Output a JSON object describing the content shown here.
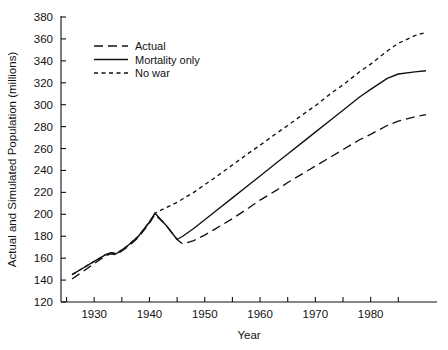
{
  "chart_data": {
    "type": "line",
    "title": "",
    "xlabel": "Year",
    "ylabel": "Actual and Simulated Population (millions)",
    "xlim": [
      1924,
      1992
    ],
    "ylim": [
      120,
      380
    ],
    "grid": false,
    "legend_position": "upper-left",
    "y_ticks": [
      120,
      140,
      160,
      180,
      200,
      220,
      240,
      260,
      280,
      300,
      320,
      340,
      360,
      380
    ],
    "y_tick_labels": [
      "120",
      "140",
      "160",
      "180",
      "200",
      "220",
      "240",
      "260",
      "280",
      "300",
      "320",
      "340",
      "360",
      "380"
    ],
    "x_ticks_major": [
      1930,
      1940,
      1950,
      1960,
      1970,
      1980
    ],
    "x_tick_labels": [
      "1930",
      "1940",
      "1950",
      "1960",
      "1970",
      "1980"
    ],
    "x_ticks_minor": [
      1925,
      1935,
      1945,
      1955,
      1965,
      1975,
      1985
    ],
    "series": [
      {
        "name": "Actual",
        "style": "long-dash",
        "dasharray": "9,5",
        "color": "#111111",
        "x": [
          1926,
          1928,
          1930,
          1932,
          1933,
          1934,
          1936,
          1938,
          1940,
          1941,
          1943,
          1945,
          1946,
          1948,
          1950,
          1952,
          1955,
          1958,
          1960,
          1963,
          1965,
          1968,
          1970,
          1973,
          1975,
          1978,
          1980,
          1983,
          1985,
          1988,
          1990
        ],
        "y": [
          141,
          148,
          155,
          162,
          164,
          163,
          170,
          179,
          192,
          200,
          190,
          177,
          173,
          176,
          181,
          187,
          196,
          206,
          213,
          222,
          229,
          238,
          244,
          253,
          259,
          268,
          273,
          281,
          285,
          289,
          291
        ]
      },
      {
        "name": "Mortality only",
        "style": "solid",
        "dasharray": "",
        "color": "#111111",
        "x": [
          1926,
          1928,
          1930,
          1932,
          1933,
          1934,
          1936,
          1938,
          1940,
          1941,
          1943,
          1945,
          1946,
          1948,
          1950,
          1952,
          1955,
          1958,
          1960,
          1963,
          1965,
          1968,
          1970,
          1973,
          1975,
          1978,
          1980,
          1983,
          1985,
          1988,
          1990
        ],
        "y": [
          145,
          151,
          157,
          163,
          165,
          164,
          171,
          180,
          193,
          201,
          190,
          177,
          180,
          187,
          195,
          203,
          215,
          227,
          235,
          247,
          255,
          267,
          275,
          287,
          295,
          307,
          314,
          324,
          328,
          330,
          331
        ]
      },
      {
        "name": "No war",
        "style": "short-dash",
        "dasharray": "4,3.5",
        "color": "#111111",
        "x": [
          1926,
          1928,
          1930,
          1932,
          1933,
          1934,
          1936,
          1938,
          1940,
          1941,
          1943,
          1945,
          1946,
          1948,
          1950,
          1952,
          1955,
          1958,
          1960,
          1963,
          1965,
          1968,
          1970,
          1973,
          1975,
          1978,
          1980,
          1983,
          1985,
          1988,
          1990
        ],
        "y": [
          145,
          151,
          157,
          163,
          165,
          164,
          171,
          180,
          193,
          201,
          206,
          211,
          214,
          220,
          227,
          234,
          245,
          256,
          263,
          274,
          281,
          292,
          299,
          311,
          318,
          330,
          337,
          349,
          356,
          363,
          366
        ]
      }
    ],
    "legend_entries": [
      {
        "label": "Actual",
        "style": "long-dash"
      },
      {
        "label": "Mortality only",
        "style": "solid"
      },
      {
        "label": "No war",
        "style": "short-dash"
      }
    ]
  }
}
